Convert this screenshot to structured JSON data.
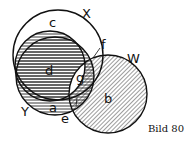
{
  "diagram": {
    "caption": "Bild 80",
    "sets": [
      {
        "name": "X",
        "region": "c"
      },
      {
        "name": "Y",
        "region": "a"
      },
      {
        "name": "W",
        "region": "b"
      }
    ],
    "labels": {
      "X": "X",
      "Y": "Y",
      "W": "W",
      "a": "a",
      "b": "b",
      "c": "c",
      "d": "d",
      "e": "e",
      "f": "f",
      "g": "g"
    },
    "shading": {
      "horizontal": [
        "d",
        "a"
      ],
      "diagonal": [
        "b"
      ]
    },
    "colors": {
      "ink": "#111111",
      "paper": "#ffffff"
    }
  }
}
